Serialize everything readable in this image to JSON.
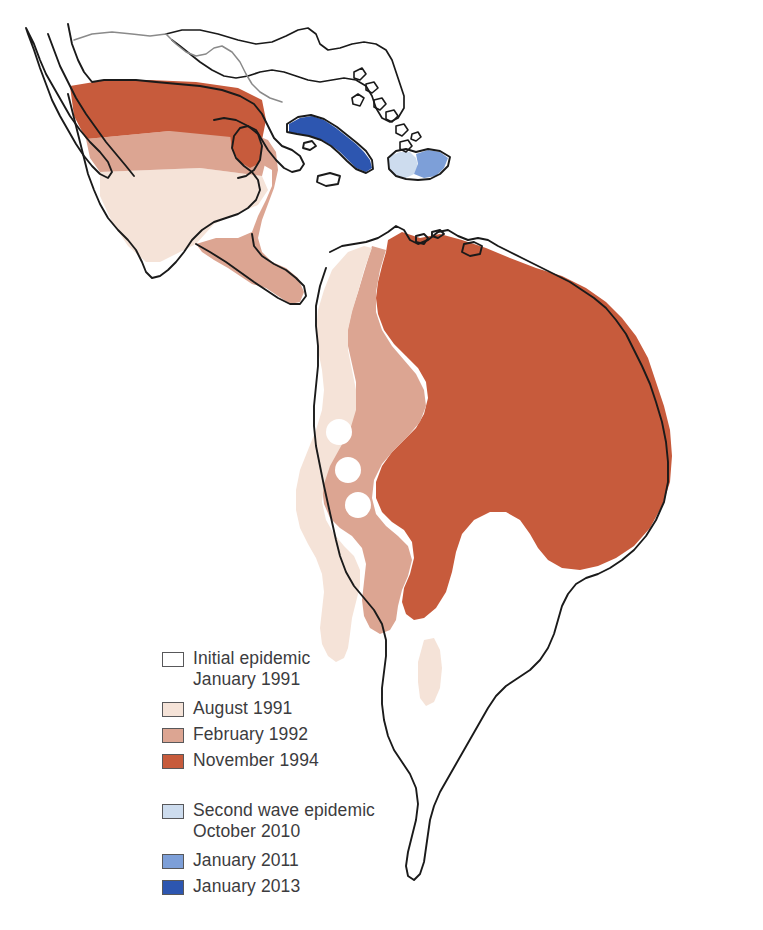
{
  "figure": {
    "type": "choropleth-map",
    "region": "Latin America and the Caribbean",
    "background_color": "#ffffff",
    "outline_color": "#1a1a1a"
  },
  "palette": {
    "initial_white": "#ffffff",
    "cream": "#f5e3d8",
    "salmon": "#dca592",
    "orange_red": "#c75b3c",
    "pale_blue": "#cddcee",
    "mid_blue": "#7d9fd8",
    "dark_blue": "#2d56b0",
    "border_dark": "#1a1a1a",
    "border_light": "#8a8a8a",
    "swatch_border": "#58585a",
    "legend_text": "#3c3c3e"
  },
  "legend": {
    "groups": [
      {
        "name": "first-wave",
        "items": [
          {
            "id": "initial-epidemic",
            "label": "Initial epidemic\nJanuary 1991",
            "color": "#ffffff",
            "date": "January 1991"
          },
          {
            "id": "august-1991",
            "label": "August 1991",
            "color": "#f5e3d8",
            "date": "August 1991"
          },
          {
            "id": "february-1992",
            "label": "February 1992",
            "color": "#dca592",
            "date": "February 1992"
          },
          {
            "id": "november-1994",
            "label": "November 1994",
            "color": "#c75b3c",
            "date": "November 1994"
          }
        ]
      },
      {
        "name": "second-wave",
        "items": [
          {
            "id": "second-wave-epidemic",
            "label": "Second wave epidemic\nOctober 2010",
            "color": "#cddcee",
            "date": "October 2010"
          },
          {
            "id": "january-2011",
            "label": "January 2011",
            "color": "#7d9fd8",
            "date": "January 2011"
          },
          {
            "id": "january-2013",
            "label": "January 2013",
            "color": "#2d56b0",
            "date": "January 2013"
          }
        ]
      }
    ]
  },
  "map_regions": [
    {
      "id": "mexico-north",
      "name": "Northern Mexico",
      "fill": "#c75b3c",
      "wave": "November 1994"
    },
    {
      "id": "mexico-central",
      "name": "Central Mexico",
      "fill": "#dca592",
      "wave": "February 1992"
    },
    {
      "id": "mexico-south",
      "name": "Southern Mexico",
      "fill": "#f5e3d8",
      "wave": "August 1991"
    },
    {
      "id": "yucatan-east",
      "name": "Eastern Yucatan and Belize",
      "fill": "#c75b3c",
      "wave": "November 1994"
    },
    {
      "id": "central-america",
      "name": "Central America",
      "fill": "#dca592",
      "wave": "February 1992"
    },
    {
      "id": "baja-california",
      "name": "Baja California",
      "fill": "#ffffff",
      "wave": "Initial epidemic January 1991"
    },
    {
      "id": "cuba",
      "name": "Cuba",
      "fill": "#2d56b0",
      "wave": "January 2013"
    },
    {
      "id": "haiti",
      "name": "Haiti",
      "fill": "#cddcee",
      "wave": "October 2010"
    },
    {
      "id": "dominican-republic",
      "name": "Dominican Republic",
      "fill": "#7d9fd8",
      "wave": "January 2011"
    },
    {
      "id": "peru-coast",
      "name": "Peru coast (initial outbreak)",
      "fill": "#f5e3d8",
      "wave": "August 1991"
    },
    {
      "id": "andes-west",
      "name": "Western Andes belt",
      "fill": "#f5e3d8",
      "wave": "August 1991"
    },
    {
      "id": "amazon-central",
      "name": "Central South America",
      "fill": "#dca592",
      "wave": "February 1992"
    },
    {
      "id": "brazil-north-east",
      "name": "Northern and eastern Brazil",
      "fill": "#c75b3c",
      "wave": "November 1994"
    },
    {
      "id": "southern-cone",
      "name": "Argentina, Chile, Uruguay",
      "fill": "#ffffff",
      "wave": "Initial epidemic January 1991"
    }
  ]
}
